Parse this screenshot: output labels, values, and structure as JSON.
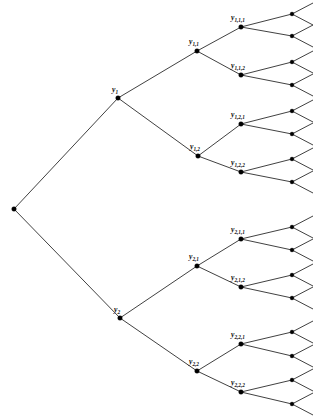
{
  "figure": {
    "type": "binary-tree-diagram",
    "width": 313,
    "height": 417,
    "background_color": "#ffffff",
    "line_color": "#2b2b2b",
    "node_color": "#000000",
    "label_color": "#111111"
  },
  "chart_data": {
    "type": "diagram",
    "title": "",
    "levels": 5,
    "branching_factor": 2
  },
  "nodes": {
    "root": {
      "id": "root",
      "label": "",
      "x": 14,
      "y": 209,
      "depth": 0
    },
    "level1": [
      {
        "id": "y1",
        "base": "y",
        "sub": "1",
        "x": 118,
        "y": 98,
        "label_x": 112,
        "label_y": 92,
        "depth": 1
      },
      {
        "id": "y2",
        "base": "y",
        "sub": "2",
        "x": 120,
        "y": 318,
        "label_x": 114,
        "label_y": 312,
        "depth": 1
      }
    ],
    "level2": [
      {
        "id": "y1_1",
        "base": "y",
        "sub": "1,1",
        "x": 197,
        "y": 51,
        "label_x": 189,
        "label_y": 44,
        "depth": 2
      },
      {
        "id": "y1_2",
        "base": "y",
        "sub": "1,2",
        "x": 198,
        "y": 156,
        "label_x": 190,
        "label_y": 149,
        "depth": 2
      },
      {
        "id": "y2_1",
        "base": "y",
        "sub": "2,1",
        "x": 197,
        "y": 266,
        "label_x": 189,
        "label_y": 259,
        "depth": 2
      },
      {
        "id": "y2_2",
        "base": "y",
        "sub": "2,2",
        "x": 197,
        "y": 371,
        "label_x": 189,
        "label_y": 364,
        "depth": 2
      }
    ],
    "level3": [
      {
        "id": "y1_1_1",
        "base": "y",
        "sub": "1,1,1",
        "x": 241,
        "y": 27,
        "label_x": 231,
        "label_y": 20,
        "depth": 3
      },
      {
        "id": "y1_1_2",
        "base": "y",
        "sub": "1,1,2",
        "x": 241,
        "y": 75,
        "label_x": 231,
        "label_y": 68,
        "depth": 3
      },
      {
        "id": "y1_2_1",
        "base": "y",
        "sub": "1,2,1",
        "x": 241,
        "y": 124,
        "label_x": 231,
        "label_y": 117,
        "depth": 3
      },
      {
        "id": "y1_2_2",
        "base": "y",
        "sub": "1,2,2",
        "x": 241,
        "y": 172,
        "label_x": 231,
        "label_y": 165,
        "depth": 3
      },
      {
        "id": "y2_1_1",
        "base": "y",
        "sub": "2,1,1",
        "x": 241,
        "y": 239,
        "label_x": 231,
        "label_y": 232,
        "depth": 3
      },
      {
        "id": "y2_1_2",
        "base": "y",
        "sub": "2,1,2",
        "x": 241,
        "y": 287,
        "label_x": 231,
        "label_y": 280,
        "depth": 3
      },
      {
        "id": "y2_2_1",
        "base": "y",
        "sub": "2,2,1",
        "x": 241,
        "y": 344,
        "label_x": 231,
        "label_y": 337,
        "depth": 3
      },
      {
        "id": "y2_2_2",
        "base": "y",
        "sub": "2,2,2",
        "x": 241,
        "y": 392,
        "label_x": 231,
        "label_y": 385,
        "depth": 3
      }
    ],
    "level4": [
      {
        "id": "leaf_1",
        "x": 292,
        "y": 14,
        "depth": 4
      },
      {
        "id": "leaf_2",
        "x": 292,
        "y": 36,
        "depth": 4
      },
      {
        "id": "leaf_3",
        "x": 292,
        "y": 62,
        "depth": 4
      },
      {
        "id": "leaf_4",
        "x": 292,
        "y": 85,
        "depth": 4
      },
      {
        "id": "leaf_5",
        "x": 292,
        "y": 111,
        "depth": 4
      },
      {
        "id": "leaf_6",
        "x": 292,
        "y": 134,
        "depth": 4
      },
      {
        "id": "leaf_7",
        "x": 292,
        "y": 159,
        "depth": 4
      },
      {
        "id": "leaf_8",
        "x": 292,
        "y": 182,
        "depth": 4
      },
      {
        "id": "leaf_9",
        "x": 292,
        "y": 227,
        "depth": 4
      },
      {
        "id": "leaf_10",
        "x": 292,
        "y": 250,
        "depth": 4
      },
      {
        "id": "leaf_11",
        "x": 292,
        "y": 275,
        "depth": 4
      },
      {
        "id": "leaf_12",
        "x": 292,
        "y": 298,
        "depth": 4
      },
      {
        "id": "leaf_13",
        "x": 292,
        "y": 332,
        "depth": 4
      },
      {
        "id": "leaf_14",
        "x": 292,
        "y": 356,
        "depth": 4
      },
      {
        "id": "leaf_15",
        "x": 292,
        "y": 380,
        "depth": 4
      },
      {
        "id": "leaf_16",
        "x": 292,
        "y": 404,
        "depth": 4
      }
    ]
  },
  "edges": [
    {
      "from": "root",
      "to": "y1"
    },
    {
      "from": "root",
      "to": "y2"
    },
    {
      "from": "y1",
      "to": "y1_1"
    },
    {
      "from": "y1",
      "to": "y1_2"
    },
    {
      "from": "y2",
      "to": "y2_1"
    },
    {
      "from": "y2",
      "to": "y2_2"
    },
    {
      "from": "y1_1",
      "to": "y1_1_1"
    },
    {
      "from": "y1_1",
      "to": "y1_1_2"
    },
    {
      "from": "y1_2",
      "to": "y1_2_1"
    },
    {
      "from": "y1_2",
      "to": "y1_2_2"
    },
    {
      "from": "y2_1",
      "to": "y2_1_1"
    },
    {
      "from": "y2_1",
      "to": "y2_1_2"
    },
    {
      "from": "y2_2",
      "to": "y2_2_1"
    },
    {
      "from": "y2_2",
      "to": "y2_2_2"
    },
    {
      "from": "y1_1_1",
      "to": "leaf_1"
    },
    {
      "from": "y1_1_1",
      "to": "leaf_2"
    },
    {
      "from": "y1_1_2",
      "to": "leaf_3"
    },
    {
      "from": "y1_1_2",
      "to": "leaf_4"
    },
    {
      "from": "y1_2_1",
      "to": "leaf_5"
    },
    {
      "from": "y1_2_1",
      "to": "leaf_6"
    },
    {
      "from": "y1_2_2",
      "to": "leaf_7"
    },
    {
      "from": "y1_2_2",
      "to": "leaf_8"
    },
    {
      "from": "y2_1_1",
      "to": "leaf_9"
    },
    {
      "from": "y2_1_1",
      "to": "leaf_10"
    },
    {
      "from": "y2_1_2",
      "to": "leaf_11"
    },
    {
      "from": "y2_1_2",
      "to": "leaf_12"
    },
    {
      "from": "y2_2_1",
      "to": "leaf_13"
    },
    {
      "from": "y2_2_1",
      "to": "leaf_14"
    },
    {
      "from": "y2_2_2",
      "to": "leaf_15"
    },
    {
      "from": "y2_2_2",
      "to": "leaf_16"
    }
  ],
  "twig_geometry": {
    "length_x": 21,
    "spread_y": 11
  }
}
